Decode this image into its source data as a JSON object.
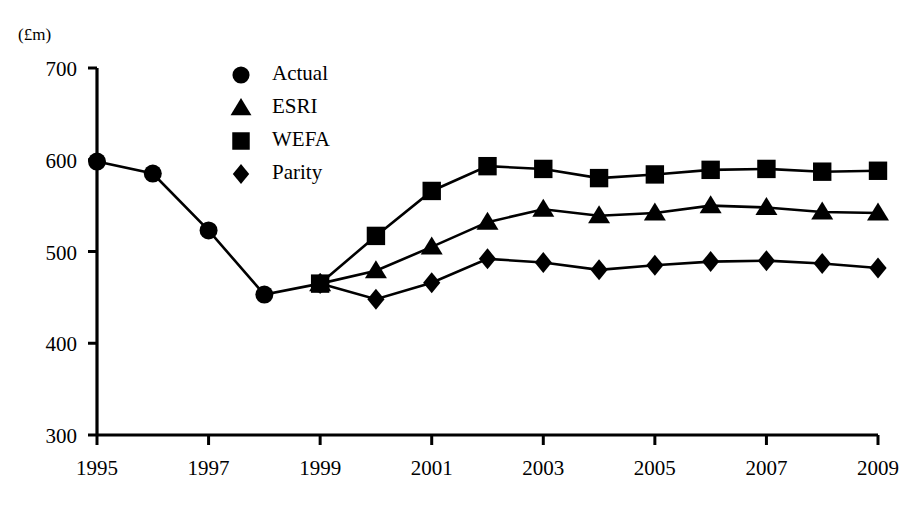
{
  "chart_data": {
    "type": "line",
    "title": "",
    "subtitle": "",
    "xlabel": "",
    "ylabel": "(£m)",
    "unit_label": "(£m)",
    "x": [
      1995,
      1996,
      1997,
      1998,
      1999,
      2000,
      2001,
      2002,
      2003,
      2004,
      2005,
      2006,
      2007,
      2008,
      2009
    ],
    "xlim": [
      1995,
      2009
    ],
    "ylim": [
      300,
      700
    ],
    "yticks": [
      300,
      400,
      500,
      600,
      700
    ],
    "ytick_labels": [
      "300",
      "400",
      "500",
      "600",
      "700"
    ],
    "xticks": [
      1995,
      1997,
      1999,
      2001,
      2003,
      2005,
      2007,
      2009
    ],
    "xtick_labels": [
      "1995",
      "1997",
      "1999",
      "2001",
      "2003",
      "2005",
      "2007",
      "2009"
    ],
    "grid": false,
    "legend_position": "top-left-inside",
    "line_color": "#000000",
    "series": [
      {
        "name": "Actual",
        "marker": "circle",
        "x": [
          1995,
          1996,
          1997,
          1998,
          1999
        ],
        "values": [
          598,
          585,
          523,
          453,
          465
        ]
      },
      {
        "name": "ESRI",
        "marker": "triangle",
        "x": [
          1999,
          2000,
          2001,
          2002,
          2003,
          2004,
          2005,
          2006,
          2007,
          2008,
          2009
        ],
        "values": [
          465,
          479,
          505,
          532,
          546,
          539,
          542,
          550,
          548,
          543,
          542
        ]
      },
      {
        "name": "WEFA",
        "marker": "square",
        "x": [
          1999,
          2000,
          2001,
          2002,
          2003,
          2004,
          2005,
          2006,
          2007,
          2008,
          2009
        ],
        "values": [
          465,
          517,
          566,
          593,
          590,
          580,
          584,
          589,
          590,
          587,
          588
        ]
      },
      {
        "name": "Parity",
        "marker": "diamond",
        "x": [
          1999,
          2000,
          2001,
          2002,
          2003,
          2004,
          2005,
          2006,
          2007,
          2008,
          2009
        ],
        "values": [
          465,
          448,
          466,
          492,
          488,
          480,
          485,
          489,
          490,
          487,
          482
        ]
      }
    ]
  },
  "legend": {
    "items": [
      {
        "label": "Actual",
        "marker": "circle"
      },
      {
        "label": "ESRI",
        "marker": "triangle"
      },
      {
        "label": "WEFA",
        "marker": "square"
      },
      {
        "label": "Parity",
        "marker": "diamond"
      }
    ]
  }
}
